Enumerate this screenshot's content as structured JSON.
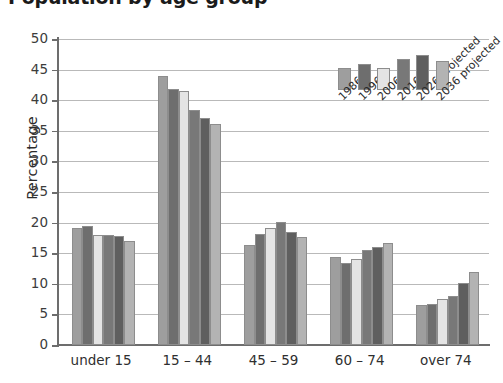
{
  "chart_data": {
    "type": "bar",
    "title": "Population by age group",
    "xlabel": "",
    "ylabel": "Percentage",
    "ylim": [
      0,
      50
    ],
    "yticks": [
      0,
      5,
      10,
      15,
      20,
      25,
      30,
      35,
      40,
      45,
      50
    ],
    "ytick_labels": [
      "0",
      "5",
      "10",
      "15",
      "20",
      "25",
      "30",
      "35",
      "40",
      "45",
      "50"
    ],
    "grid": true,
    "legend_position": "upper-right-inside",
    "categories": [
      "under 15",
      "15 – 44",
      "45 – 59",
      "60 – 74",
      "over 74"
    ],
    "series": [
      {
        "name": "1986",
        "color": "#9e9e9e",
        "values": [
          19.2,
          44.0,
          16.4,
          14.3,
          6.5
        ]
      },
      {
        "name": "1996",
        "color": "#6e6e6e",
        "values": [
          19.4,
          41.8,
          18.1,
          13.4,
          6.7
        ]
      },
      {
        "name": "2006",
        "color": "#e4e4e4",
        "values": [
          17.9,
          41.5,
          19.2,
          14.0,
          7.5
        ]
      },
      {
        "name": "2016",
        "color": "#787878",
        "values": [
          18.0,
          38.4,
          20.1,
          15.6,
          8.0
        ]
      },
      {
        "name": "2026 projected",
        "color": "#5f5f5f",
        "values": [
          17.8,
          37.1,
          18.5,
          16.0,
          10.2
        ]
      },
      {
        "name": "2036 projected",
        "color": "#b3b3b3",
        "values": [
          17.0,
          36.1,
          17.6,
          16.6,
          12.0
        ]
      }
    ]
  },
  "legend": {
    "entries": [
      "1986",
      "1996",
      "2006",
      "2016",
      "2026 projected",
      "2036 projected"
    ]
  }
}
